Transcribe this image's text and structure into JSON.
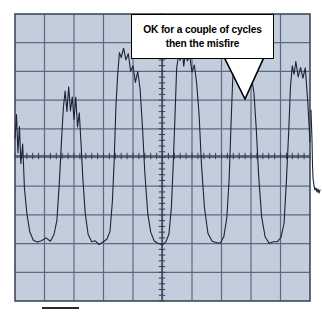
{
  "figure": {
    "name": "oscilloscope-waveform-capture",
    "background_color": "#ffffff",
    "graticule": {
      "fill_color": "#c3cddc",
      "grid_line_color": "#5b6b82",
      "border_color": "#3d4a5c",
      "left": 15,
      "top": 14,
      "right": 310,
      "bottom": 301,
      "divisions_x": 10,
      "divisions_y": 10,
      "center_axis_x": 162,
      "center_axis_y": 156,
      "minor_ticks_per_division": 5
    },
    "trace": {
      "color": "#1b2336",
      "line_width": 1.1,
      "description": "noisy square-wave ignition pattern"
    },
    "scale_bar": {
      "color": "#2b2b2b",
      "left": 42,
      "right": 79,
      "y": 308
    }
  },
  "callout": {
    "line1": "OK for a couple of cycles",
    "line2": "then the misfire",
    "background_color": "#ffffff",
    "border_color": "#000000",
    "text_color": "#000000",
    "tail_target_x": 245,
    "tail_target_y": 99
  },
  "chart_data": {
    "type": "line",
    "title": "",
    "xlabel": "",
    "ylabel": "",
    "grid": true,
    "legend": null,
    "xlim": [
      0,
      10
    ],
    "ylim": [
      -5,
      5
    ],
    "annotations": [
      {
        "text": "OK for a couple of cycles then the misfire",
        "x": 7.8,
        "y": 2.0
      }
    ],
    "series": [
      {
        "name": "Ignition secondary voltage",
        "comment": "Noisy square-wave pulse train; x in divisions from left edge, y in divisions above the center horizontal axis (positive up).",
        "points": [
          [
            0.0,
            0.6
          ],
          [
            0.05,
            1.4
          ],
          [
            0.1,
            0.1
          ],
          [
            0.15,
            1.0
          ],
          [
            0.2,
            -0.3
          ],
          [
            0.26,
            0.4
          ],
          [
            0.32,
            -1.1
          ],
          [
            0.4,
            -2.0
          ],
          [
            0.5,
            -2.6
          ],
          [
            0.62,
            -2.9
          ],
          [
            0.75,
            -3.0
          ],
          [
            0.9,
            -3.0
          ],
          [
            1.05,
            -2.9
          ],
          [
            1.2,
            -2.95
          ],
          [
            1.32,
            -2.8
          ],
          [
            1.42,
            -2.2
          ],
          [
            1.5,
            -1.0
          ],
          [
            1.58,
            0.6
          ],
          [
            1.64,
            1.6
          ],
          [
            1.7,
            2.1
          ],
          [
            1.76,
            1.5
          ],
          [
            1.82,
            2.3
          ],
          [
            1.88,
            1.6
          ],
          [
            1.94,
            2.2
          ],
          [
            2.0,
            1.3
          ],
          [
            2.06,
            1.9
          ],
          [
            2.12,
            1.0
          ],
          [
            2.18,
            1.6
          ],
          [
            2.24,
            0.4
          ],
          [
            2.3,
            -0.8
          ],
          [
            2.38,
            -2.0
          ],
          [
            2.48,
            -2.7
          ],
          [
            2.6,
            -2.95
          ],
          [
            2.72,
            -3.0
          ],
          [
            2.85,
            -3.05
          ],
          [
            3.0,
            -3.0
          ],
          [
            3.12,
            -2.95
          ],
          [
            3.22,
            -2.6
          ],
          [
            3.3,
            -1.6
          ],
          [
            3.36,
            -0.2
          ],
          [
            3.42,
            1.6
          ],
          [
            3.48,
            3.0
          ],
          [
            3.54,
            3.5
          ],
          [
            3.6,
            3.3
          ],
          [
            3.68,
            3.6
          ],
          [
            3.76,
            3.4
          ],
          [
            3.84,
            3.5
          ],
          [
            3.92,
            3.1
          ],
          [
            4.0,
            3.2
          ],
          [
            4.08,
            2.7
          ],
          [
            4.16,
            2.9
          ],
          [
            4.24,
            2.2
          ],
          [
            4.32,
            1.0
          ],
          [
            4.4,
            -0.6
          ],
          [
            4.5,
            -2.0
          ],
          [
            4.6,
            -2.7
          ],
          [
            4.72,
            -3.0
          ],
          [
            4.86,
            -3.1
          ],
          [
            5.0,
            -3.05
          ],
          [
            5.12,
            -3.0
          ],
          [
            5.22,
            -2.7
          ],
          [
            5.3,
            -1.8
          ],
          [
            5.36,
            -0.4
          ],
          [
            5.42,
            1.4
          ],
          [
            5.48,
            2.9
          ],
          [
            5.54,
            3.6
          ],
          [
            5.6,
            3.2
          ],
          [
            5.66,
            3.9
          ],
          [
            5.72,
            3.3
          ],
          [
            5.78,
            3.8
          ],
          [
            5.84,
            3.2
          ],
          [
            5.92,
            3.4
          ],
          [
            6.0,
            2.9
          ],
          [
            6.08,
            3.0
          ],
          [
            6.16,
            2.4
          ],
          [
            6.24,
            1.3
          ],
          [
            6.32,
            -0.3
          ],
          [
            6.42,
            -1.8
          ],
          [
            6.54,
            -2.7
          ],
          [
            6.68,
            -3.0
          ],
          [
            6.82,
            -3.05
          ],
          [
            6.96,
            -3.0
          ],
          [
            7.08,
            -2.8
          ],
          [
            7.18,
            -2.2
          ],
          [
            7.26,
            -0.8
          ],
          [
            7.32,
            1.0
          ],
          [
            7.38,
            2.6
          ],
          [
            7.44,
            3.5
          ],
          [
            7.5,
            3.1
          ],
          [
            7.56,
            3.7
          ],
          [
            7.62,
            3.0
          ],
          [
            7.7,
            3.4
          ],
          [
            7.78,
            2.9
          ],
          [
            7.86,
            3.1
          ],
          [
            7.94,
            2.6
          ],
          [
            8.02,
            2.8
          ],
          [
            8.1,
            2.1
          ],
          [
            8.18,
            0.9
          ],
          [
            8.26,
            -0.7
          ],
          [
            8.36,
            -2.1
          ],
          [
            8.48,
            -2.8
          ],
          [
            8.62,
            -3.0
          ],
          [
            8.76,
            -3.05
          ],
          [
            8.9,
            -3.0
          ],
          [
            9.02,
            -2.8
          ],
          [
            9.12,
            -2.3
          ],
          [
            9.2,
            -0.9
          ],
          [
            9.28,
            0.9
          ],
          [
            9.34,
            2.4
          ],
          [
            9.4,
            3.3
          ],
          [
            9.46,
            2.9
          ],
          [
            9.52,
            3.4
          ],
          [
            9.6,
            2.9
          ],
          [
            9.68,
            3.2
          ],
          [
            9.76,
            2.7
          ],
          [
            9.84,
            2.9
          ],
          [
            9.92,
            2.0
          ],
          [
            10.0,
            0.5
          ]
        ]
      }
    ]
  }
}
